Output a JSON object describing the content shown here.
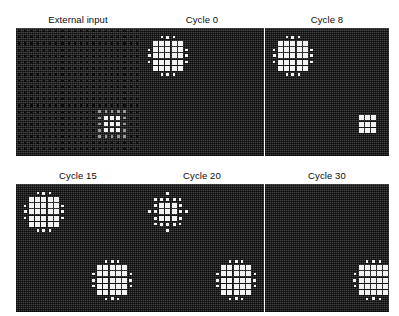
{
  "figure": {
    "layout": {
      "rows": 2,
      "cols": 3
    },
    "panel_width": 124,
    "panel_height": 128,
    "field_size": 20,
    "colors": {
      "background": "#ffffff",
      "field_background": "#313131",
      "active_unit": "#f2f2f2",
      "inactive_unit": "#0a0a0a",
      "partial_unit": "#9a9a9a",
      "title_text": "#0b0b0b"
    }
  },
  "panels": [
    {
      "id": "external-input",
      "title": "External input",
      "row": 0,
      "col": 0,
      "kind": "input",
      "description": "Uniform lattice of weak inactive units with one strong bright stimulus patch in the lower-right quadrant.",
      "lattice": {
        "cols": 20,
        "rows": 20,
        "dot_level": "inactive"
      },
      "stimuli": [
        {
          "name": "lower-right-input",
          "center_col": 15,
          "center_row": 15,
          "core_cols": [
            13,
            14,
            15,
            16,
            17
          ],
          "core_rows": [
            13,
            14,
            15,
            16,
            17
          ],
          "peak_cols": [
            14,
            15,
            16
          ],
          "peak_rows": [
            14,
            15,
            16
          ]
        }
      ]
    },
    {
      "id": "cycle-0",
      "title": "Cycle 0",
      "row": 0,
      "col": 1,
      "kind": "activity",
      "description": "Single large activity blob in the upper-left; lower-right field is silent.",
      "blobs": [
        {
          "name": "upper-left-blob",
          "center_col": 4,
          "center_row": 4,
          "core_radius": 2,
          "halo_radius": 3,
          "intensity": "high"
        }
      ]
    },
    {
      "id": "cycle-8",
      "title": "Cycle 8",
      "row": 0,
      "col": 2,
      "kind": "activity",
      "description": "Upper-left blob still large; a small compact blob has emerged in the lower-right.",
      "blobs": [
        {
          "name": "upper-left-blob",
          "center_col": 4,
          "center_row": 4,
          "core_radius": 2,
          "halo_radius": 3,
          "intensity": "high"
        },
        {
          "name": "lower-right-blob",
          "center_col": 16,
          "center_row": 15,
          "core_radius": 1,
          "halo_radius": 1,
          "intensity": "medium"
        }
      ]
    },
    {
      "id": "cycle-15",
      "title": "Cycle 15",
      "row": 1,
      "col": 0,
      "kind": "activity",
      "description": "Both blobs are active at comparable size; the lower-right blob has grown to match the upper-left.",
      "blobs": [
        {
          "name": "upper-left-blob",
          "center_col": 4,
          "center_row": 4,
          "core_radius": 2,
          "halo_radius": 3,
          "intensity": "high"
        },
        {
          "name": "lower-right-blob",
          "center_col": 15,
          "center_row": 15,
          "core_radius": 2,
          "halo_radius": 3,
          "intensity": "high"
        }
      ]
    },
    {
      "id": "cycle-20",
      "title": "Cycle 20",
      "row": 1,
      "col": 1,
      "kind": "activity",
      "description": "Upper-left blob has shrunk to a small core with scattered satellites; lower-right blob remains large.",
      "blobs": [
        {
          "name": "upper-left-blob",
          "center_col": 4,
          "center_row": 4,
          "core_radius": 1,
          "halo_radius": 3,
          "intensity": "medium"
        },
        {
          "name": "lower-right-blob",
          "center_col": 15,
          "center_row": 15,
          "core_radius": 2,
          "halo_radius": 3,
          "intensity": "high"
        }
      ]
    },
    {
      "id": "cycle-30",
      "title": "Cycle 30",
      "row": 1,
      "col": 2,
      "kind": "activity",
      "description": "Upper-left blob has fully decayed; only the lower-right blob survives, clipped by the field edge.",
      "blobs": [
        {
          "name": "lower-right-blob",
          "center_col": 17,
          "center_row": 15,
          "core_radius": 2,
          "halo_radius": 3,
          "intensity": "high"
        }
      ]
    }
  ],
  "chart_data": {
    "type": "heatmap",
    "xlabel": "",
    "ylabel": "",
    "grid": false,
    "legend": "none",
    "field_dimensions": [
      20,
      20
    ],
    "panel_titles": [
      "External input",
      "Cycle 0",
      "Cycle 8",
      "Cycle 15",
      "Cycle 20",
      "Cycle 30"
    ],
    "cycles": [
      null,
      0,
      8,
      15,
      20,
      30
    ],
    "series": [
      {
        "name": "upper-left blob size (active units)",
        "x": [
          0,
          8,
          15,
          20,
          30
        ],
        "values": [
          21,
          21,
          21,
          9,
          0
        ]
      },
      {
        "name": "lower-right blob size (active units)",
        "x": [
          0,
          8,
          15,
          20,
          30
        ],
        "values": [
          0,
          9,
          21,
          21,
          21
        ]
      }
    ],
    "value_levels": {
      "inactive": 0,
      "partial": 0.5,
      "active": 1
    }
  }
}
